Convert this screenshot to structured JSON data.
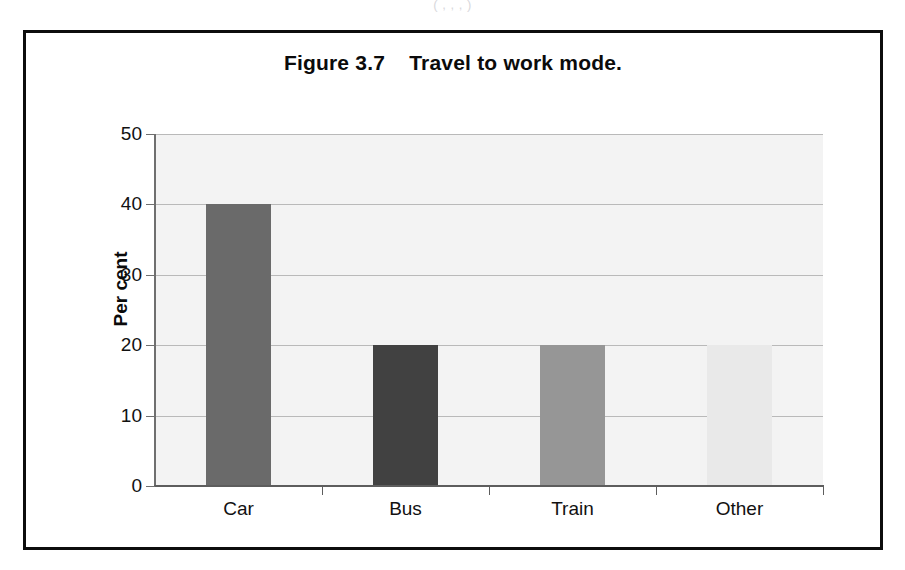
{
  "scan_artifact": {
    "text": "(               ,              ,             ,         )"
  },
  "figure": {
    "title": "Figure 3.7    Travel to work mode.",
    "border_color": "#0d0d0d"
  },
  "chart_data": {
    "type": "bar",
    "title": "Figure 3.7    Travel to work mode.",
    "categories": [
      "Car",
      "Bus",
      "Train",
      "Other"
    ],
    "values": [
      40,
      20,
      20,
      20
    ],
    "bar_colors": [
      "#6a6a6a",
      "#414141",
      "#969696",
      "#e9e9e9"
    ],
    "xlabel": "",
    "ylabel": "Per cent",
    "ylim": [
      0,
      50
    ],
    "yticks": [
      0,
      10,
      20,
      30,
      40,
      50
    ],
    "ytick_labels": [
      "0",
      "10",
      "20",
      "30",
      "40",
      "50"
    ],
    "grid": true,
    "grid_color": "#b9b9b9",
    "plot_background": "#f3f3f3",
    "legend": null,
    "legend_position": "none"
  }
}
